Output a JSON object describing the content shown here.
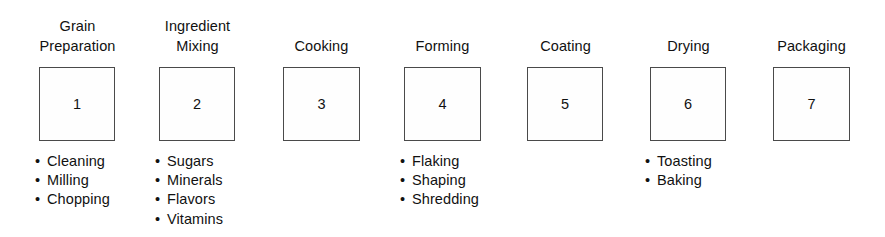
{
  "diagram": {
    "background_color": "#ffffff",
    "box_border_color": "#4a4a4a",
    "text_color": "#111111",
    "bullet_glyph": "•",
    "stages": [
      {
        "id": "grain-preparation",
        "title": "Grain\nPreparation",
        "title_lines": 2,
        "number": "1",
        "items": [
          "Cleaning",
          "Milling",
          "Chopping"
        ]
      },
      {
        "id": "ingredient-mixing",
        "title": "Ingredient\nMixing",
        "title_lines": 2,
        "number": "2",
        "items": [
          "Sugars",
          "Minerals",
          "Flavors",
          "Vitamins"
        ]
      },
      {
        "id": "cooking",
        "title": "Cooking",
        "title_lines": 1,
        "number": "3",
        "items": []
      },
      {
        "id": "forming",
        "title": "Forming",
        "title_lines": 1,
        "number": "4",
        "items": [
          "Flaking",
          "Shaping",
          "Shredding"
        ]
      },
      {
        "id": "coating",
        "title": "Coating",
        "title_lines": 1,
        "number": "5",
        "items": []
      },
      {
        "id": "drying",
        "title": "Drying",
        "title_lines": 1,
        "number": "6",
        "items": [
          "Toasting",
          "Baking"
        ]
      },
      {
        "id": "packaging",
        "title": "Packaging",
        "title_lines": 1,
        "number": "7",
        "items": []
      }
    ]
  },
  "layout": {
    "stage_geometry": [
      {
        "col_left": 20,
        "col_width": 115,
        "box_left": 39,
        "box_width": 76,
        "box_height": 74,
        "list_left": 35
      },
      {
        "col_left": 140,
        "col_width": 115,
        "box_left": 159,
        "box_width": 76,
        "box_height": 74,
        "list_left": 155
      },
      {
        "col_left": 264,
        "col_width": 115,
        "box_left": 283,
        "box_width": 77,
        "box_height": 74,
        "list_left": 279
      },
      {
        "col_left": 385,
        "col_width": 115,
        "box_left": 404,
        "box_width": 77,
        "box_height": 74,
        "list_left": 400
      },
      {
        "col_left": 508,
        "col_width": 115,
        "box_left": 527,
        "box_width": 76,
        "box_height": 74,
        "list_left": 523
      },
      {
        "col_left": 631,
        "col_width": 115,
        "box_left": 650,
        "box_width": 76,
        "box_height": 74,
        "list_left": 645
      },
      {
        "col_left": 754,
        "col_width": 115,
        "box_left": 773,
        "box_width": 77,
        "box_height": 74,
        "list_left": 769
      }
    ]
  }
}
